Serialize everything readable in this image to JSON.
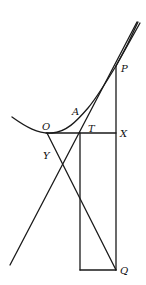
{
  "diagram": {
    "type": "geometric-construction",
    "colors": {
      "line": "#1a1a1a",
      "background": "#ffffff",
      "label": "#111111"
    },
    "labels": {
      "P": "P",
      "A": "A",
      "O": "O",
      "T": "T",
      "X": "X",
      "Y": "Y",
      "Q": "Q"
    },
    "points": {
      "P": [
        116,
        66
      ],
      "A": [
        80,
        108
      ],
      "O": [
        52,
        133
      ],
      "T": [
        82,
        133
      ],
      "X": [
        116,
        133
      ],
      "Y": [
        60,
        160
      ],
      "Q": [
        116,
        270
      ]
    }
  }
}
